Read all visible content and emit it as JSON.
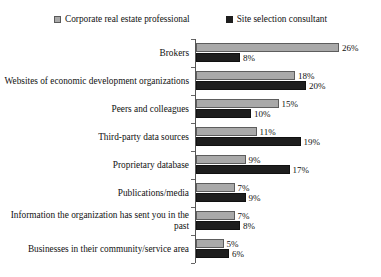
{
  "chart_data": {
    "type": "bar",
    "orientation": "horizontal",
    "title": "",
    "xlabel": "",
    "ylabel": "",
    "grid": false,
    "legend_position": "top-center",
    "value_suffix": "%",
    "xlim": [
      0,
      26
    ],
    "categories": [
      "Brokers",
      "Websites of economic development organizations",
      "Peers and colleagues",
      "Third-party data sources",
      "Proprietary database",
      "Publications/media",
      "Information the organization has sent you in the past",
      "Businesses in their community/service area"
    ],
    "series": [
      {
        "name": "Corporate real estate professional",
        "color": "#a9a9a9",
        "values": [
          26,
          18,
          15,
          11,
          9,
          7,
          7,
          5
        ],
        "labels": [
          "26%",
          "18%",
          "15%",
          "11%",
          "9%",
          "7%",
          "7%",
          "5%"
        ]
      },
      {
        "name": "Site selection consultant",
        "color": "#1e1e1e",
        "values": [
          8,
          20,
          10,
          19,
          17,
          9,
          8,
          6
        ],
        "labels": [
          "8%",
          "20%",
          "10%",
          "19%",
          "17%",
          "9%",
          "8%",
          "6%"
        ]
      }
    ]
  },
  "legend": {
    "entries": [
      {
        "label": "Corporate real estate professional",
        "swatch": "series-a-swatch"
      },
      {
        "label": "Site selection consultant",
        "swatch": "series-b-swatch"
      }
    ]
  }
}
